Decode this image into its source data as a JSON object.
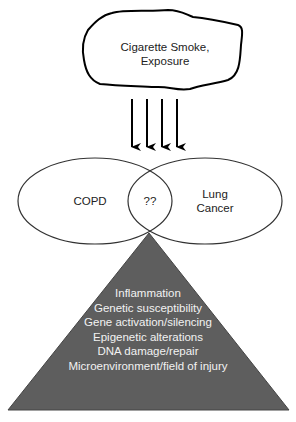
{
  "cloud": {
    "line1": "Cigarette  Smoke,",
    "line2": "Exposure"
  },
  "arrows": {
    "count": 4
  },
  "venn": {
    "left_label": "COPD",
    "overlap_label": "??",
    "right_label_line1": "Lung",
    "right_label_line2": "Cancer"
  },
  "triangle": {
    "fill_color": "#5e5e5e",
    "items": [
      "Inflammation",
      "Genetic susceptibility",
      "Gene activation/silencing",
      "Epigenetic alterations",
      "DNA damage/repair",
      "Microenvironment/field of injury"
    ]
  }
}
